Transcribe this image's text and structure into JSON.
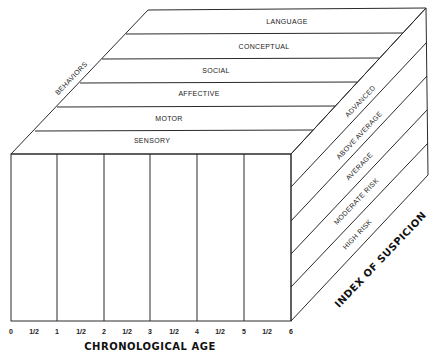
{
  "diagram": {
    "type": "3d-cube-framework",
    "top_face": {
      "axis_label": "BEHAVIORS",
      "bands": [
        "LANGUAGE",
        "CONCEPTUAL",
        "SOCIAL",
        "AFFECTIVE",
        "MOTOR",
        "SENSORY"
      ]
    },
    "right_face": {
      "axis_label": "INDEX OF SUSPICION",
      "bands": [
        "ADVANCED",
        "ABOVE AVERAGE",
        "AVERAGE",
        "MODERATE RISK",
        "HIGH RISK"
      ]
    },
    "front_face": {
      "axis_label": "CHRONOLOGICAL AGE",
      "ticks": [
        "0",
        "1/2",
        "1",
        "1/2",
        "2",
        "1/2",
        "3",
        "1/2",
        "4",
        "1/2",
        "5",
        "1/2",
        "6"
      ]
    },
    "colors": {
      "line": "#2a2a2a",
      "text": "#222222",
      "background": "#ffffff"
    }
  }
}
